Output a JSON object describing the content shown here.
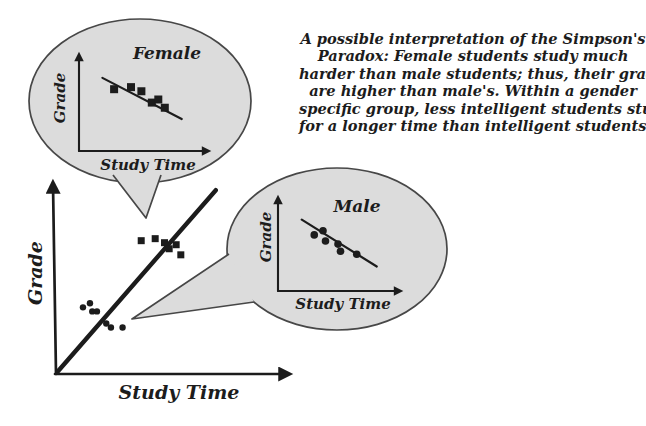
{
  "caption": {
    "lines": [
      "A possible interpretation of the Simpson's",
      "Paradox: Female students study much",
      "harder than male students; thus, their grades",
      "are higher than male's. Within a gender",
      "specific group, less intelligent students study",
      "for a longer time than intelligent students."
    ]
  },
  "main_chart": {
    "xlabel": "Study Time",
    "ylabel": "Grade"
  },
  "female_bubble": {
    "title": "Female",
    "xlabel": "Study Time",
    "ylabel": "Grade"
  },
  "male_bubble": {
    "title": "Male",
    "xlabel": "Study Time",
    "ylabel": "Grade"
  },
  "icons": [
    "speech-bubble-female",
    "speech-bubble-male",
    "arrow-axis-up",
    "arrow-axis-right",
    "square-marker-female",
    "circle-marker-male"
  ],
  "colors": {
    "ink": "#1c1c1c",
    "bubble_fill": "#dcdcdc",
    "bubble_stroke": "#474747",
    "background": "#ffffff"
  },
  "chart_data": [
    {
      "id": "main",
      "type": "scatter",
      "title": "",
      "xlabel": "Study Time",
      "ylabel": "Grade",
      "xlim": [
        0,
        10
      ],
      "ylim": [
        0,
        10
      ],
      "grid": false,
      "legend": "none",
      "series": [
        {
          "name": "female",
          "marker": "square",
          "points": [
            [
              3.7,
              6.6
            ],
            [
              4.3,
              6.7
            ],
            [
              4.7,
              6.5
            ],
            [
              4.9,
              6.2
            ],
            [
              5.2,
              6.4
            ],
            [
              5.4,
              5.9
            ]
          ]
        },
        {
          "name": "male",
          "marker": "circle",
          "points": [
            [
              1.2,
              3.3
            ],
            [
              1.5,
              3.5
            ],
            [
              1.6,
              3.1
            ],
            [
              1.8,
              3.1
            ],
            [
              2.2,
              2.5
            ],
            [
              2.4,
              2.3
            ],
            [
              2.9,
              2.3
            ]
          ]
        }
      ],
      "trend_line": {
        "from": [
          0.1,
          0.1
        ],
        "to": [
          6.9,
          9.1
        ],
        "direction": "positive"
      }
    },
    {
      "id": "female",
      "type": "scatter",
      "title": "Female",
      "xlabel": "Study Time",
      "ylabel": "Grade",
      "xlim": [
        0,
        10
      ],
      "ylim": [
        0,
        10
      ],
      "grid": false,
      "legend": "none",
      "series": [
        {
          "name": "female",
          "marker": "square",
          "points": [
            [
              2.7,
              6.0
            ],
            [
              4.0,
              6.2
            ],
            [
              4.8,
              5.8
            ],
            [
              5.6,
              4.7
            ],
            [
              6.1,
              5.0
            ],
            [
              6.6,
              4.2
            ]
          ]
        }
      ],
      "trend_line": {
        "from": [
          1.8,
          7.1
        ],
        "to": [
          7.9,
          3.1
        ],
        "direction": "negative"
      }
    },
    {
      "id": "male",
      "type": "scatter",
      "title": "Male",
      "xlabel": "Study Time",
      "ylabel": "Grade",
      "xlim": [
        0,
        10
      ],
      "ylim": [
        0,
        10
      ],
      "grid": false,
      "legend": "none",
      "series": [
        {
          "name": "male",
          "marker": "circle",
          "points": [
            [
              2.9,
              5.5
            ],
            [
              3.6,
              5.9
            ],
            [
              3.8,
              4.9
            ],
            [
              4.8,
              4.6
            ],
            [
              5.0,
              3.9
            ],
            [
              6.3,
              3.6
            ]
          ]
        }
      ],
      "trend_line": {
        "from": [
          1.9,
          7.0
        ],
        "to": [
          7.9,
          2.4
        ],
        "direction": "negative"
      }
    }
  ]
}
